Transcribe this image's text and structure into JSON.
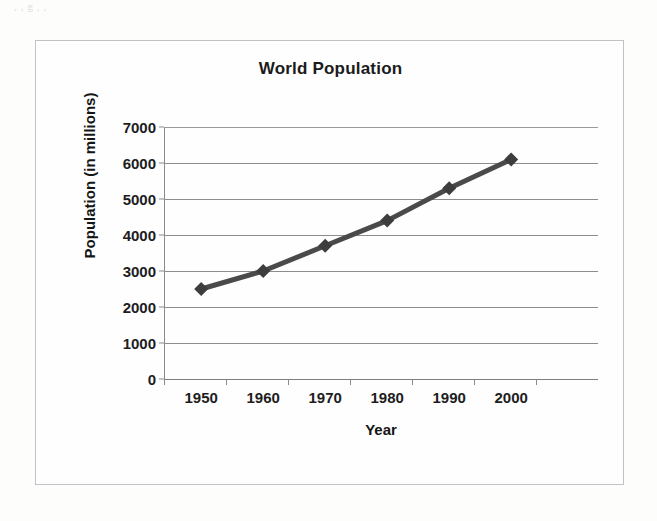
{
  "figure": {
    "title": "World Population",
    "frame_border_color": "#c2c2c2",
    "background_color": "#fefefe"
  },
  "scan_artifacts": {
    "top_text": ",                            ,  g         ,                        ,",
    "bottom_text": ""
  },
  "chart_data": {
    "type": "line",
    "title": "World Population",
    "xlabel": "Year",
    "ylabel": "Population (in millions)",
    "categories": [
      "1950",
      "1960",
      "1970",
      "1980",
      "1990",
      "2000"
    ],
    "x": [
      1950,
      1960,
      1970,
      1980,
      1990,
      2000
    ],
    "values": [
      2500,
      3000,
      3700,
      4400,
      5300,
      6100
    ],
    "series": [
      {
        "name": "World Population",
        "values": [
          2500,
          3000,
          3700,
          4400,
          5300,
          6100
        ],
        "line_color": "#4a4a4a",
        "marker": "diamond",
        "marker_color": "#3d3d3d"
      }
    ],
    "ylim": [
      0,
      7000
    ],
    "ytick_values": [
      0,
      1000,
      2000,
      3000,
      4000,
      5000,
      6000,
      7000
    ],
    "ytick_labels": [
      "0",
      "1000",
      "2000",
      "3000",
      "4000",
      "5000",
      "6000",
      "7000"
    ],
    "xtick_labels": [
      "1950",
      "1960",
      "1970",
      "1980",
      "1990",
      "2000"
    ],
    "grid": true,
    "grid_axis": "y",
    "grid_color": "#8d8d8d",
    "legend": false,
    "legend_position": "none"
  }
}
